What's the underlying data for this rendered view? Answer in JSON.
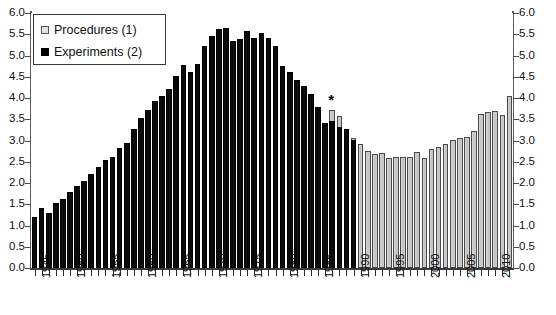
{
  "chart_data": {
    "type": "bar",
    "title": "",
    "subtitle": "",
    "xlabel": "",
    "ylabel": "",
    "ylim": [
      0.0,
      6.0
    ],
    "y_tick_step": 0.5,
    "grid": true,
    "dual_axis": true,
    "legend_position": "top-left",
    "y_ticks": [
      "0.0",
      "0.5",
      "1.0",
      "1.5",
      "2.0",
      "2.5",
      "3.0",
      "3.5",
      "4.0",
      "4.5",
      "5.0",
      "5.5",
      "6.0"
    ],
    "y_ticks_right": [
      "0.0",
      "0.5",
      "1.0",
      "1.5",
      "2.0",
      "2.5",
      "3.0",
      "3.5",
      "4.0",
      "4.5",
      "5.0",
      "5.5",
      "6.0"
    ],
    "x_tick_labels": [
      "1945",
      "1950",
      "1955",
      "1960",
      "1965",
      "1970",
      "1975",
      "1980",
      "1985",
      "1990",
      "1995",
      "2000",
      "2005",
      "2010"
    ],
    "categories": [
      "1945",
      "1946",
      "1947",
      "1948",
      "1949",
      "1950",
      "1951",
      "1952",
      "1953",
      "1954",
      "1955",
      "1956",
      "1957",
      "1958",
      "1959",
      "1960",
      "1961",
      "1962",
      "1963",
      "1964",
      "1965",
      "1966",
      "1967",
      "1968",
      "1969",
      "1970",
      "1971",
      "1972",
      "1973",
      "1974",
      "1975",
      "1976",
      "1977",
      "1978",
      "1979",
      "1980",
      "1981",
      "1982",
      "1983",
      "1984",
      "1985",
      "1986",
      "1987",
      "1988",
      "1989",
      "1990",
      "1991",
      "1992",
      "1993",
      "1994",
      "1995",
      "1996",
      "1997",
      "1998",
      "1999",
      "2000",
      "2001",
      "2002",
      "2003",
      "2004",
      "2005",
      "2006",
      "2007",
      "2008",
      "2009",
      "2010",
      "2011",
      "2012"
    ],
    "annotations": [
      {
        "text": "*",
        "category": "1987",
        "value": 3.75,
        "note": "asterisk marks change of counting basis"
      }
    ],
    "series": [
      {
        "name": "Experiments (2)",
        "key": "experiments",
        "color": "#0a0a0a",
        "values": [
          1.2,
          1.42,
          1.3,
          1.52,
          1.62,
          1.78,
          1.92,
          2.05,
          2.22,
          2.38,
          2.55,
          2.62,
          2.82,
          2.95,
          3.28,
          3.52,
          3.72,
          3.92,
          4.05,
          4.22,
          4.52,
          4.78,
          4.62,
          4.8,
          5.22,
          5.45,
          5.62,
          5.65,
          5.35,
          5.4,
          5.58,
          5.42,
          5.52,
          5.42,
          5.22,
          4.75,
          4.62,
          4.42,
          4.28,
          4.1,
          3.78,
          3.42,
          3.45,
          3.32,
          3.28,
          3.02,
          null,
          null,
          null,
          null,
          null,
          null,
          null,
          null,
          null,
          null,
          null,
          null,
          null,
          null,
          null,
          null,
          null,
          null,
          null,
          null,
          null,
          null
        ]
      },
      {
        "name": "Procedures (1)",
        "key": "procedures",
        "color": "#c9c9c9",
        "values": [
          null,
          null,
          null,
          null,
          null,
          null,
          null,
          null,
          null,
          null,
          null,
          null,
          null,
          null,
          null,
          null,
          null,
          null,
          null,
          null,
          null,
          null,
          null,
          null,
          null,
          null,
          null,
          null,
          null,
          null,
          null,
          null,
          null,
          null,
          null,
          null,
          null,
          null,
          null,
          null,
          null,
          null,
          3.72,
          3.58,
          3.12,
          3.05,
          2.92,
          2.75,
          2.68,
          2.7,
          2.6,
          2.62,
          2.62,
          2.62,
          2.72,
          2.6,
          2.8,
          2.85,
          2.92,
          3.02,
          3.05,
          3.08,
          3.22,
          3.62,
          3.68,
          3.7,
          3.6,
          4.05
        ]
      }
    ]
  },
  "legend": {
    "items": [
      {
        "label": "Procedures (1)",
        "swatch": "procedures",
        "icon": "legend-square-light"
      },
      {
        "label": "Experiments (2)",
        "swatch": "experiments",
        "icon": "legend-square-dark"
      }
    ]
  }
}
